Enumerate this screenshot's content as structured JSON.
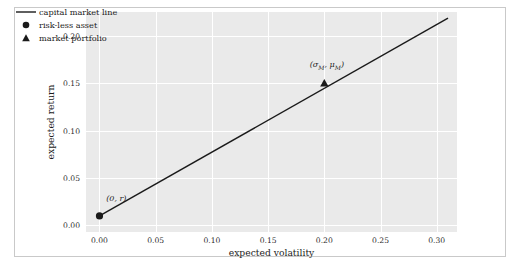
{
  "chart_data": {
    "type": "line",
    "title": "",
    "xlabel": "expected volatility",
    "ylabel": "expected return",
    "xlim": [
      -0.012,
      0.318
    ],
    "ylim": [
      -0.007,
      0.225
    ],
    "xticks": [
      "0.00",
      "0.05",
      "0.10",
      "0.15",
      "0.20",
      "0.25",
      "0.30"
    ],
    "xtick_values": [
      0.0,
      0.05,
      0.1,
      0.15,
      0.2,
      0.25,
      0.3
    ],
    "yticks": [
      "0.00",
      "0.05",
      "0.10",
      "0.15",
      "0.20"
    ],
    "ytick_values": [
      0.0,
      0.05,
      0.1,
      0.15,
      0.2
    ],
    "grid": true,
    "grid_color": "#ffffff",
    "plot_bgcolor": "#eaeaea",
    "legend_position": "upper left",
    "series": [
      {
        "name": "capital market line",
        "type": "line",
        "color": "#1a1a1a",
        "x": [
          0.0,
          0.31
        ],
        "y": [
          0.01,
          0.2185
        ]
      },
      {
        "name": "risk-less asset",
        "type": "scatter",
        "marker": "circle",
        "color": "#1a1a1a",
        "x": [
          0.0
        ],
        "y": [
          0.01
        ]
      },
      {
        "name": "market portfolio",
        "type": "scatter",
        "marker": "triangle",
        "color": "#1a1a1a",
        "x": [
          0.2
        ],
        "y": [
          0.15
        ]
      }
    ],
    "annotations": [
      {
        "text": "(0, r)",
        "x": 0.0,
        "y": 0.01,
        "label_x": 0.006,
        "label_y": 0.027
      },
      {
        "text": "(σM, μM)",
        "x": 0.2,
        "y": 0.15,
        "label_x": 0.187,
        "label_y": 0.168
      }
    ]
  },
  "legend": {
    "items": [
      {
        "label": "capital market line",
        "marker": "line"
      },
      {
        "label": "risk-less asset",
        "marker": "circle"
      },
      {
        "label": "market portfolio",
        "marker": "triangle"
      }
    ]
  },
  "axes": {
    "xlabel": "expected volatility",
    "ylabel": "expected return",
    "xticks": [
      "0.00",
      "0.05",
      "0.10",
      "0.15",
      "0.20",
      "0.25",
      "0.30"
    ],
    "yticks": [
      "0.00",
      "0.05",
      "0.10",
      "0.15",
      "0.20"
    ]
  },
  "annotations": {
    "riskfree": {
      "open": "(0, ",
      "sym": "r",
      "close": ")"
    },
    "market": {
      "open": "(",
      "sigma": "σ",
      "subM1": "M",
      "comma": ", ",
      "mu": "μ",
      "subM2": "M",
      "close": ")"
    }
  }
}
